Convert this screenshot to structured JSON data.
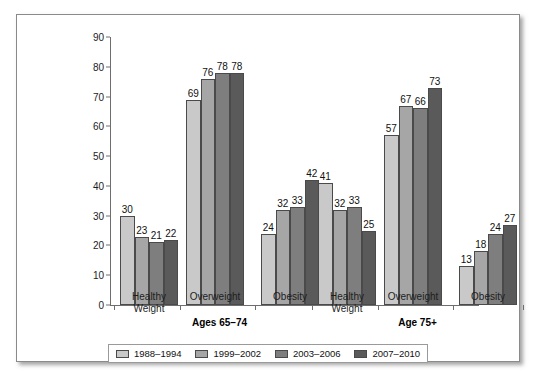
{
  "chart_data": {
    "type": "bar",
    "title": "",
    "xlabel": "",
    "ylabel": "",
    "ylim": [
      0,
      90
    ],
    "ytick_step": 10,
    "yticks": [
      0,
      10,
      20,
      30,
      40,
      50,
      60,
      70,
      80,
      90
    ],
    "grid": false,
    "legend_position": "bottom",
    "categories": [
      "Healthy Weight",
      "Overweight",
      "Obesity",
      "Healthy Weight",
      "Overweight",
      "Obesity"
    ],
    "super_groups": [
      {
        "label": "Ages 65–74",
        "categories": [
          "Healthy Weight",
          "Overweight",
          "Obesity"
        ]
      },
      {
        "label": "Age 75+",
        "categories": [
          "Healthy Weight",
          "Overweight",
          "Obesity"
        ]
      }
    ],
    "series": [
      {
        "name": "1988–1994",
        "color": "#c9c9c9",
        "values": [
          30,
          69,
          24,
          41,
          57,
          13
        ]
      },
      {
        "name": "1999–2002",
        "color": "#a6a6a6",
        "values": [
          23,
          76,
          32,
          32,
          67,
          18
        ]
      },
      {
        "name": "2003–2006",
        "color": "#7e7e7e",
        "values": [
          21,
          78,
          33,
          33,
          66,
          24
        ]
      },
      {
        "name": "2007–2010",
        "color": "#5a5a5a",
        "values": [
          22,
          78,
          42,
          25,
          73,
          27
        ]
      }
    ]
  },
  "legend": {
    "items": [
      {
        "label": "1988–1994",
        "color": "#c9c9c9"
      },
      {
        "label": "1999–2002",
        "color": "#a6a6a6"
      },
      {
        "label": "2003–2006",
        "color": "#7e7e7e"
      },
      {
        "label": "2007–2010",
        "color": "#5a5a5a"
      }
    ]
  }
}
